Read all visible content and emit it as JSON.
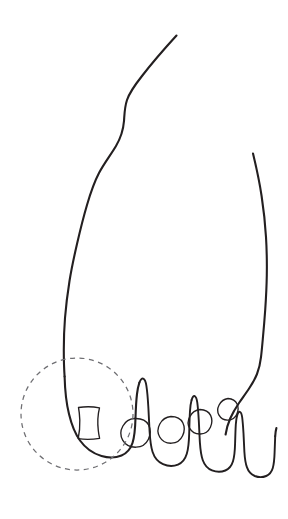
{
  "figure": {
    "title": "Foot outline line drawing",
    "caption": "",
    "background_color": "#ffffff",
    "ink_color": "#231f20",
    "highlight_color": "#6f6f73",
    "width": 288,
    "height": 519,
    "style": "hand-drawn single-weight contour line art, no shading, no text labels"
  },
  "annotation": {
    "type": "dashed-circle",
    "label": "",
    "target": "big toe",
    "center_x": 77,
    "center_y": 414,
    "radius": 56,
    "stroke_color": "#6f6f73",
    "dash_pattern": "5 4.5"
  },
  "parts": [
    {
      "name": "foot-outline-left",
      "description": "left medial contour of foot running from upper right down to the big toe"
    },
    {
      "name": "foot-outline-right",
      "description": "right lateral contour of foot running from top down to the little toe"
    },
    {
      "name": "big-toe",
      "description": "large rounded first toe at lower left, circled by the dashed annotation"
    },
    {
      "name": "second-toe",
      "description": "second toe to the right of the big toe"
    },
    {
      "name": "third-toe",
      "description": "middle toe"
    },
    {
      "name": "fourth-toe",
      "description": "fourth toe"
    },
    {
      "name": "little-toe",
      "description": "smallest fifth toe at the right edge"
    }
  ],
  "toenails": [
    {
      "name": "big-toenail",
      "shape": "squarish with slightly concave sides",
      "center_x": 88,
      "center_y": 424
    },
    {
      "name": "second-toenail",
      "shape": "rounded square",
      "center_x": 134,
      "center_y": 434
    },
    {
      "name": "third-toenail",
      "shape": "rounded square",
      "center_x": 170,
      "center_y": 432
    },
    {
      "name": "fourth-toenail",
      "shape": "rounded square",
      "center_x": 200,
      "center_y": 425
    },
    {
      "name": "little-toenail",
      "shape": "small rounded square",
      "center_x": 228,
      "center_y": 413
    }
  ]
}
